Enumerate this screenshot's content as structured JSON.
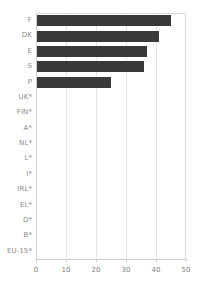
{
  "chart_data": {
    "type": "bar",
    "orientation": "horizontal",
    "title": "",
    "subtitle": "",
    "xlabel": "",
    "ylabel": "",
    "xlim": [
      0,
      50
    ],
    "ylim": null,
    "grid": true,
    "grid_axis": "x",
    "legend": false,
    "legend_position": "none",
    "xticks": [
      0,
      10,
      20,
      30,
      40,
      50
    ],
    "xtick_labels": [
      "0",
      "10",
      "20",
      "30",
      "40",
      "50"
    ],
    "categories": [
      "F",
      "DK",
      "E",
      "S",
      "P",
      "UK*",
      "FIN*",
      "A*",
      "NL*",
      "L*",
      "I*",
      "IRL*",
      "EL*",
      "D*",
      "B*",
      "EU-15*"
    ],
    "values": [
      45,
      41,
      37,
      36,
      25,
      0,
      0,
      0,
      0,
      0,
      0,
      0,
      0,
      0,
      0,
      0
    ],
    "annotations": []
  },
  "style": {
    "bar_color": "#3a3a3a",
    "grid_color": "#e6e6e6",
    "axis_color": "#cfcfcf",
    "tick_label_color": "#7d7d7d",
    "category_label_color": "#8a8a8a",
    "background_color": "#ffffff"
  }
}
